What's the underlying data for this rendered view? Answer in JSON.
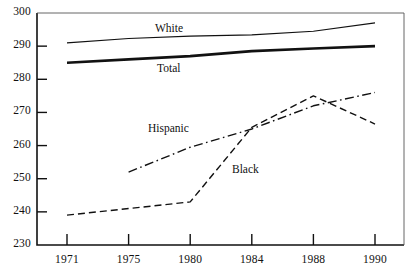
{
  "chart_data": {
    "type": "line",
    "title": "",
    "subtitle": "",
    "xlabel": "",
    "ylabel": "",
    "x": [
      1971,
      1975,
      1980,
      1984,
      1988,
      1990
    ],
    "x_tick_labels": [
      "1971",
      "1975",
      "1980",
      "1984",
      "1988",
      "1990"
    ],
    "y_tick_labels": [
      "230",
      "240",
      "250",
      "260",
      "270",
      "280",
      "290",
      "300"
    ],
    "y_ticks": [
      230,
      240,
      250,
      260,
      270,
      280,
      290,
      300
    ],
    "ylim": [
      230,
      300
    ],
    "grid": false,
    "legend_position": "inline-annotations",
    "series": [
      {
        "name": "White",
        "label": "White",
        "style": "solid",
        "width": 1.2,
        "color": "#111111",
        "x": [
          1971,
          1975,
          1980,
          1984,
          1988,
          1990
        ],
        "values": [
          291,
          292.3,
          293,
          293.4,
          294.5,
          297
        ]
      },
      {
        "name": "Total",
        "label": "Total",
        "style": "solid-bold",
        "width": 2.6,
        "color": "#111111",
        "x": [
          1971,
          1975,
          1980,
          1984,
          1988,
          1990
        ],
        "values": [
          285,
          286,
          287,
          288.5,
          289.3,
          290
        ]
      },
      {
        "name": "Hispanic",
        "label": "Hispanic",
        "style": "dash-dot",
        "width": 1.4,
        "color": "#111111",
        "x": [
          1975,
          1980,
          1984,
          1988,
          1990
        ],
        "values": [
          252,
          259.5,
          265,
          272,
          276
        ]
      },
      {
        "name": "Black",
        "label": "Black",
        "style": "dashed",
        "width": 1.4,
        "color": "#111111",
        "x": [
          1971,
          1975,
          1980,
          1984,
          1988,
          1990
        ],
        "values": [
          239,
          241,
          243,
          265.5,
          275,
          266.5
        ]
      }
    ],
    "annotations": [
      {
        "text": "White",
        "x_px": 155,
        "y_px": 22
      },
      {
        "text": "Total",
        "x_px": 157,
        "y_px": 62
      },
      {
        "text": "Hispanic",
        "x_px": 148,
        "y_px": 122
      },
      {
        "text": "Black",
        "x_px": 232,
        "y_px": 163
      }
    ]
  },
  "axes": {
    "plot_left_px": 37,
    "plot_right_px": 404,
    "plot_top_px": 13,
    "plot_bottom_px": 245
  }
}
